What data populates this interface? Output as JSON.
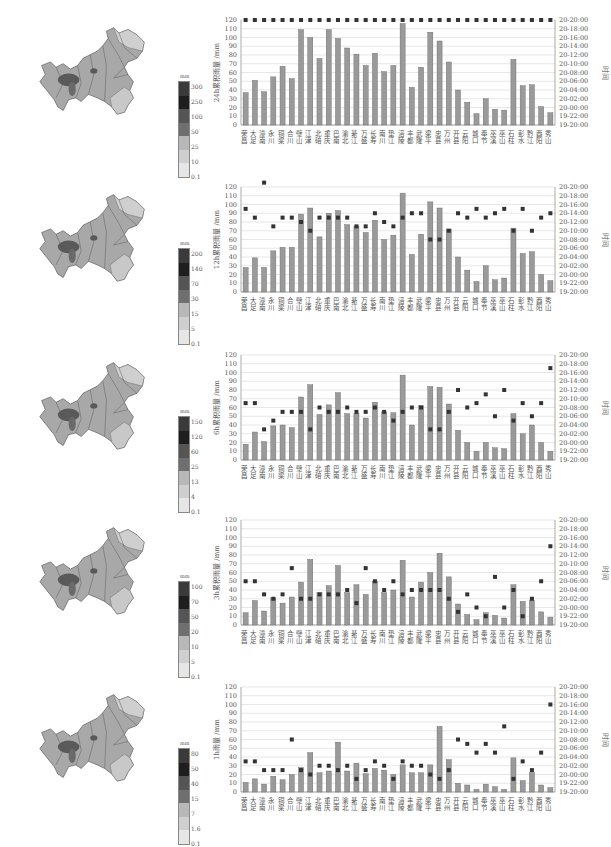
{
  "stations": [
    "荣昌",
    "大足",
    "潼南",
    "永川",
    "铜梁",
    "合川",
    "璧山",
    "江津",
    "北碚",
    "重庆",
    "巴南",
    "渝北",
    "綦江",
    "万盛",
    "长寿",
    "南川",
    "垫江",
    "涪陵",
    "丰都",
    "武隆",
    "梁平",
    "忠县",
    "万州",
    "开县",
    "云阳",
    "城口",
    "奉节",
    "巫溪",
    "巫山",
    "石柱",
    "彭水",
    "黔江",
    "酉阳",
    "秀山"
  ],
  "right_axis_ticks": [
    "19-20:00",
    "19-22:00",
    "20-00:00",
    "20-02:00",
    "20-04:00",
    "20-06:00",
    "20-08:00",
    "20-10:00",
    "20-12:00",
    "20-14:00",
    "20-16:00",
    "20-18:00",
    "20-20:00"
  ],
  "right_axis_label": "时间",
  "left_axis_ticks": [
    "0",
    "10",
    "20",
    "30",
    "40",
    "50",
    "60",
    "70",
    "80",
    "90",
    "100",
    "110",
    "120"
  ],
  "colors": {
    "bar": "#9a9a9a",
    "bar_edge": "#666666",
    "marker": "#333333",
    "grid": "#dddddd"
  },
  "chart_data": [
    {
      "type": "bar",
      "title": "",
      "ylabel": "24h累积雨量 /mm",
      "y2label": "时间",
      "ylim": [
        0,
        120
      ],
      "categories": [
        "荣昌",
        "大足",
        "潼南",
        "永川",
        "铜梁",
        "合川",
        "璧山",
        "江津",
        "北碚",
        "重庆",
        "巴南",
        "渝北",
        "綦江",
        "万盛",
        "长寿",
        "南川",
        "垫江",
        "涪陵",
        "丰都",
        "武隆",
        "梁平",
        "忠县",
        "万州",
        "开县",
        "云阳",
        "城口",
        "奉节",
        "巫溪",
        "巫山",
        "石柱",
        "彭水",
        "黔江",
        "酉阳",
        "秀山"
      ],
      "series": [
        {
          "name": "24h累积雨量",
          "axis": "left",
          "values": [
            37,
            51,
            38,
            55,
            67,
            53,
            109,
            100,
            76,
            109,
            99,
            88,
            81,
            68,
            82,
            61,
            68,
            116,
            43,
            66,
            106,
            96,
            72,
            40,
            26,
            13,
            30,
            18,
            17,
            75,
            45,
            46,
            21,
            14
          ]
        },
        {
          "name": "出现时间",
          "axis": "right",
          "values_hours": [
            24,
            24,
            24,
            24,
            24,
            24,
            24,
            24,
            24,
            24,
            24,
            24,
            24,
            24,
            24,
            24,
            24,
            24,
            24,
            24,
            24,
            24,
            24,
            24,
            24,
            24,
            24,
            24,
            24,
            24,
            24,
            24,
            24,
            24
          ]
        }
      ],
      "legend_map": {
        "unit": "mm",
        "ticks": [
          "0.1",
          "10",
          "25",
          "50",
          "100",
          "250",
          "300"
        ]
      }
    },
    {
      "type": "bar",
      "title": "",
      "ylabel": "12h累积雨量 /mm",
      "y2label": "时间",
      "ylim": [
        0,
        120
      ],
      "categories": [
        "荣昌",
        "大足",
        "潼南",
        "永川",
        "铜梁",
        "合川",
        "璧山",
        "江津",
        "北碚",
        "重庆",
        "巴南",
        "渝北",
        "綦江",
        "万盛",
        "长寿",
        "南川",
        "垫江",
        "涪陵",
        "丰都",
        "武隆",
        "梁平",
        "忠县",
        "万州",
        "开县",
        "云阳",
        "城口",
        "奉节",
        "巫溪",
        "巫山",
        "石柱",
        "彭水",
        "黔江",
        "酉阳",
        "秀山"
      ],
      "series": [
        {
          "name": "12h累积雨量",
          "axis": "left",
          "values": [
            28,
            39,
            28,
            47,
            51,
            51,
            89,
            96,
            63,
            90,
            93,
            77,
            75,
            68,
            82,
            60,
            65,
            113,
            43,
            66,
            103,
            96,
            72,
            40,
            25,
            12,
            30,
            14,
            16,
            73,
            44,
            46,
            20,
            13
          ]
        },
        {
          "name": "出现时间",
          "axis": "right",
          "values_hours": [
            19,
            17,
            25,
            15,
            17,
            17,
            16,
            14,
            17,
            17,
            17,
            17,
            15,
            15,
            18,
            16,
            15,
            17,
            18,
            18,
            12,
            12,
            14,
            18,
            17,
            19,
            17,
            18,
            19,
            14,
            19,
            14,
            17,
            18
          ]
        }
      ],
      "legend_map": {
        "unit": "mm",
        "ticks": [
          "0.1",
          "5",
          "15",
          "30",
          "70",
          "140",
          "200"
        ]
      }
    },
    {
      "type": "bar",
      "title": "",
      "ylabel": "6h累积雨量 /mm",
      "y2label": "时间",
      "ylim": [
        0,
        120
      ],
      "categories": [
        "荣昌",
        "大足",
        "潼南",
        "永川",
        "铜梁",
        "合川",
        "璧山",
        "江津",
        "北碚",
        "重庆",
        "巴南",
        "渝北",
        "綦江",
        "万盛",
        "长寿",
        "南川",
        "垫江",
        "涪陵",
        "丰都",
        "武隆",
        "梁平",
        "忠县",
        "万州",
        "开县",
        "云阳",
        "城口",
        "奉节",
        "巫溪",
        "巫山",
        "石柱",
        "彭水",
        "黔江",
        "酉阳",
        "秀山"
      ],
      "series": [
        {
          "name": "6h累积雨量",
          "axis": "left",
          "values": [
            18,
            32,
            21,
            39,
            40,
            37,
            72,
            86,
            52,
            63,
            77,
            53,
            53,
            48,
            66,
            55,
            54,
            97,
            40,
            62,
            84,
            83,
            64,
            34,
            20,
            10,
            20,
            14,
            13,
            53,
            30,
            40,
            20,
            10
          ]
        },
        {
          "name": "出现时间",
          "axis": "right",
          "values_hours": [
            13,
            13,
            7,
            9,
            11,
            11,
            11,
            7,
            12,
            11,
            11,
            12,
            11,
            11,
            12,
            11,
            9,
            11,
            12,
            12,
            7,
            7,
            11,
            16,
            12,
            13,
            15,
            10,
            16,
            9,
            13,
            10,
            13,
            21
          ]
        }
      ],
      "legend_map": {
        "unit": "mm",
        "ticks": [
          "0.1",
          "4",
          "13",
          "25",
          "60",
          "120",
          "150"
        ]
      }
    },
    {
      "type": "bar",
      "title": "",
      "ylabel": "3h累积雨量 /mm",
      "y2label": "时间",
      "ylim": [
        0,
        120
      ],
      "categories": [
        "荣昌",
        "大足",
        "潼南",
        "永川",
        "铜梁",
        "合川",
        "璧山",
        "江津",
        "北碚",
        "重庆",
        "巴南",
        "渝北",
        "綦江",
        "万盛",
        "长寿",
        "南川",
        "垫江",
        "涪陵",
        "丰都",
        "武隆",
        "梁平",
        "忠县",
        "万州",
        "开县",
        "云阳",
        "城口",
        "奉节",
        "巫溪",
        "巫山",
        "石柱",
        "彭水",
        "黔江",
        "酉阳",
        "秀山"
      ],
      "series": [
        {
          "name": "3h累积雨量",
          "axis": "left",
          "values": [
            14,
            28,
            16,
            31,
            25,
            32,
            49,
            75,
            37,
            45,
            68,
            37,
            46,
            35,
            50,
            37,
            40,
            74,
            32,
            49,
            60,
            82,
            55,
            24,
            12,
            6,
            14,
            11,
            8,
            46,
            27,
            28,
            15,
            9
          ]
        },
        {
          "name": "出现时间",
          "axis": "right",
          "values_hours": [
            10,
            10,
            7,
            6,
            7,
            13,
            6,
            6,
            7,
            7,
            7,
            8,
            5,
            13,
            10,
            8,
            10,
            7,
            8,
            8,
            8,
            8,
            6,
            3,
            7,
            4,
            2,
            11,
            4,
            8,
            2,
            6,
            10,
            18
          ]
        }
      ],
      "legend_map": {
        "unit": "mm",
        "ticks": [
          "0.1",
          "5",
          "10",
          "20",
          "50",
          "70",
          "100"
        ]
      }
    },
    {
      "type": "bar",
      "title": "",
      "ylabel": "1h雨量 /mm",
      "y2label": "时间",
      "ylim": [
        0,
        120
      ],
      "categories": [
        "荣昌",
        "大足",
        "潼南",
        "永川",
        "铜梁",
        "合川",
        "璧山",
        "江津",
        "北碚",
        "重庆",
        "巴南",
        "渝北",
        "綦江",
        "万盛",
        "长寿",
        "南川",
        "垫江",
        "涪陵",
        "丰都",
        "武隆",
        "梁平",
        "忠县",
        "万州",
        "开县",
        "云阳",
        "城口",
        "奉节",
        "巫溪",
        "巫山",
        "石柱",
        "彭水",
        "黔江",
        "酉阳",
        "秀山"
      ],
      "series": [
        {
          "name": "1h雨量",
          "axis": "left",
          "values": [
            11,
            15,
            9,
            18,
            14,
            20,
            28,
            45,
            22,
            24,
            57,
            24,
            33,
            21,
            27,
            25,
            20,
            31,
            22,
            22,
            31,
            75,
            37,
            10,
            8,
            3,
            9,
            6,
            3,
            39,
            13,
            22,
            8,
            5
          ]
        },
        {
          "name": "出现时间",
          "axis": "right",
          "values_hours": [
            7,
            7,
            5,
            5,
            5,
            12,
            5,
            4,
            6,
            6,
            5,
            6,
            3,
            5,
            7,
            6,
            3,
            7,
            6,
            6,
            4,
            3,
            5,
            12,
            11,
            9,
            11,
            9,
            15,
            3,
            7,
            5,
            9,
            20
          ]
        }
      ],
      "legend_map": {
        "unit": "mm",
        "ticks": [
          "0.1",
          "1.6",
          "7",
          "15",
          "40",
          "50",
          "80"
        ]
      }
    }
  ]
}
